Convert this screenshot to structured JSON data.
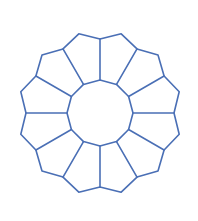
{
  "diagram": {
    "type": "radial-polygon-ring",
    "segments": 12,
    "center": [
      100,
      113
    ],
    "inner_radius": 33,
    "spoke_outer_radius": 74,
    "corner_radius": 82,
    "stroke_color": "#4a6fb5",
    "stroke_width": 1.6,
    "background": "#ffffff"
  }
}
